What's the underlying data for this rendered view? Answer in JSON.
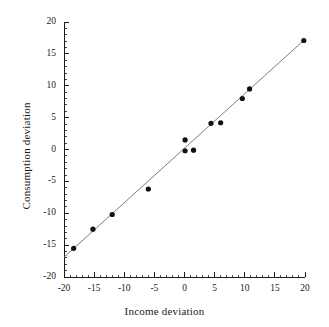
{
  "chart_data": {
    "type": "scatter",
    "title": "",
    "xlabel": "Income deviation",
    "ylabel": "Consumption deviation",
    "xlim": [
      -20,
      20
    ],
    "ylim": [
      -20,
      20
    ],
    "xticks": [
      -20,
      -15,
      -10,
      -5,
      0,
      5,
      10,
      15,
      20
    ],
    "xticklabels": [
      "-20",
      "-15",
      "-10",
      "-5",
      "0",
      "5",
      "10",
      "15",
      "20"
    ],
    "yticks": [
      -20,
      -15,
      -10,
      -5,
      0,
      5,
      10,
      15,
      20
    ],
    "yticklabels": [
      "-20",
      "-15",
      "-10",
      "-5",
      "0",
      "5",
      "10",
      "15",
      "20"
    ],
    "minor_tick_step": 1,
    "grid": false,
    "legend": "none",
    "marker_color": "#111111",
    "line_color": "#6e6e6e",
    "points": [
      {
        "x": -18.4,
        "y": -15.5
      },
      {
        "x": -15.2,
        "y": -12.5
      },
      {
        "x": -12.0,
        "y": -10.2
      },
      {
        "x": -6.0,
        "y": -6.2
      },
      {
        "x": 0.1,
        "y": 1.5
      },
      {
        "x": 0.1,
        "y": -0.2
      },
      {
        "x": 1.5,
        "y": -0.1
      },
      {
        "x": 4.4,
        "y": 4.1
      },
      {
        "x": 6.0,
        "y": 4.2
      },
      {
        "x": 9.6,
        "y": 8.0
      },
      {
        "x": 10.8,
        "y": 9.5
      },
      {
        "x": 19.8,
        "y": 17.1
      }
    ],
    "fit_line": {
      "type": "linear",
      "x": [
        -20,
        20
      ],
      "y": [
        -16.9,
        17.3
      ],
      "slope": 0.855,
      "intercept": 0.2
    }
  }
}
